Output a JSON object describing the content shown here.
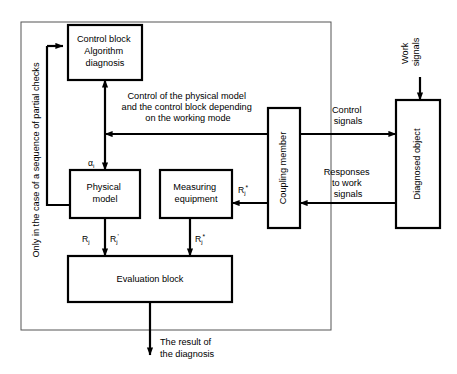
{
  "diagram": {
    "outer_frame_label": "Only in the case of a sequence of partial checks",
    "blocks": {
      "control_block": {
        "line1": "Control block",
        "line2": "Algorithm",
        "line3": "diagnosis"
      },
      "physical_model": {
        "line1": "Physical",
        "line2": "model"
      },
      "measuring_equipment": {
        "line1": "Measuring",
        "line2": "equipment"
      },
      "evaluation_block": {
        "label": "Evaluation block"
      },
      "coupling_member": {
        "label": "Coupling member"
      },
      "diagnosed_object": {
        "label": "Diagnosed object"
      }
    },
    "annotations": {
      "control_note_line1": "Control of the physical model",
      "control_note_line2": "and the control block depending",
      "control_note_line3": "on the working mode",
      "work_signals_line1": "Work",
      "work_signals_line2": "signals",
      "control_signals_line1": "Control",
      "control_signals_line2": "signals",
      "responses_line1": "Responses",
      "responses_line2": "to work",
      "responses_line3": "signals",
      "result_line1": "The result of",
      "result_line2": "the diagnosis"
    },
    "signals": {
      "alpha": {
        "base": "α",
        "sub": "i"
      },
      "r_j": {
        "base": "R",
        "sub": "j",
        "sup": ""
      },
      "r_j_prime": {
        "base": "R",
        "sub": "j",
        "sup": "'"
      },
      "r_j_star_eval": {
        "base": "R",
        "sub": "j",
        "sup": "*"
      },
      "r_j_star_coupling": {
        "base": "R",
        "sub": "j",
        "sup": "*"
      }
    },
    "colors": {
      "stroke": "#000000",
      "fill": "#ffffff",
      "frame": "#555555"
    }
  }
}
